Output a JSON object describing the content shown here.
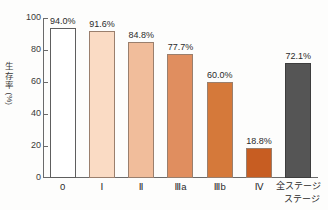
{
  "chart_data": {
    "type": "bar",
    "title": "",
    "xlabel": "ステージ",
    "ylabel": "生存率（%）",
    "ylabel_chars": [
      "生",
      "存",
      "率"
    ],
    "ylabel_unit": "(%)",
    "ylim": [
      0,
      100
    ],
    "yticks": [
      100,
      80,
      60,
      40,
      20,
      0
    ],
    "grid": false,
    "legend": "none",
    "categories": [
      "0",
      "Ⅰ",
      "Ⅱ",
      "Ⅲa",
      "Ⅲb",
      "Ⅳ",
      "全ステージ"
    ],
    "values": [
      94.0,
      91.6,
      84.8,
      77.7,
      60.0,
      18.8,
      72.1
    ],
    "data_labels": [
      "94.0%",
      "91.6%",
      "84.8%",
      "77.7%",
      "60.0%",
      "18.8%",
      "72.1%"
    ],
    "bar_colors": [
      "#ffffff",
      "#fadbc4",
      "#f1bd9b",
      "#e08e5f",
      "#d5793a",
      "#c75d22",
      "#555555"
    ],
    "bar_border_colors": [
      "#5e5e5e",
      "#9a7f6d",
      "#9a7f6d",
      "#9a7f6d",
      "#9a7f6d",
      "#9a7f6d",
      "#3d3d3d"
    ]
  }
}
